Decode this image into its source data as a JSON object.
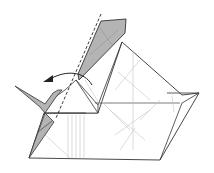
{
  "diagram": {
    "type": "origami-fold-step",
    "colors": {
      "paper": "#ffffff",
      "shaded_flap": "#b4b4b4",
      "outline": "#333333",
      "crease": "#c8c8c8",
      "fold_line": "#222222",
      "arrow": "#222222"
    },
    "elements": {
      "fold_line": "valley-fold-dashed-line",
      "arrow": "fold-direction-arrow-left",
      "shaded_regions": [
        "top-flap",
        "left-flap-upper",
        "left-flap-lower"
      ]
    }
  }
}
